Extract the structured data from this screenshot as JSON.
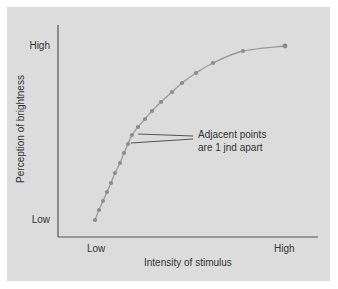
{
  "chart_data": {
    "type": "line",
    "title": "",
    "xlabel": "Intensity of stimulus",
    "ylabel": "Perception of brightness",
    "x_ticks": [
      "Low",
      "High"
    ],
    "y_ticks": [
      "Low",
      "High"
    ],
    "grid": false,
    "annotation": [
      "Adjacent points",
      "are 1 jnd apart"
    ],
    "series": [
      {
        "name": "Perceived brightness vs. stimulus intensity",
        "description": "Concave (compressive) curve; equally spaced perceptual steps (1 jnd) require increasingly larger intensity increments",
        "points_px": [
          [
            95,
            220
          ],
          [
            99,
            210
          ],
          [
            103,
            201
          ],
          [
            107,
            192
          ],
          [
            111,
            183
          ],
          [
            115,
            173
          ],
          [
            120,
            163
          ],
          [
            124,
            153
          ],
          [
            128,
            144
          ],
          [
            132,
            135
          ],
          [
            138,
            127
          ],
          [
            145,
            119
          ],
          [
            152,
            111
          ],
          [
            161,
            102
          ],
          [
            172,
            92
          ],
          [
            182,
            83
          ],
          [
            196,
            73
          ],
          [
            213,
            63
          ],
          [
            243,
            51
          ],
          [
            285,
            46
          ]
        ]
      }
    ],
    "colors": {
      "background": "#dcdcdc",
      "axis": "#555555",
      "curve": "#9a9a9a",
      "points": "#8c8c8c",
      "text": "#333333"
    }
  }
}
